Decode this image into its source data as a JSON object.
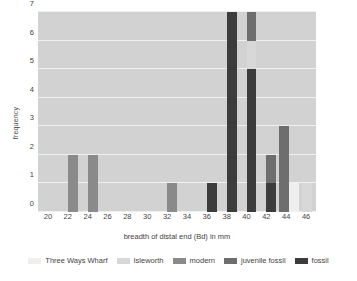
{
  "chart_data": {
    "type": "bar",
    "title": "",
    "xlabel": "breadth of distal end (Bd) in mm",
    "ylabel": "frequency",
    "xlim": [
      19,
      47
    ],
    "ylim": [
      0,
      7
    ],
    "yticks": [
      0,
      1,
      2,
      3,
      4,
      5,
      6,
      7
    ],
    "xticks": [
      20,
      22,
      24,
      26,
      28,
      30,
      32,
      34,
      36,
      38,
      40,
      42,
      44,
      46
    ],
    "grid": true,
    "stacked": true,
    "legend_position": "bottom",
    "plot_background": "#d2d2d2",
    "gridline_color": "#f0f0f0",
    "series": [
      {
        "name": "Three Ways Wharf",
        "color": "#efefef"
      },
      {
        "name": "Isleworth",
        "color": "#d8d8d8"
      },
      {
        "name": "modern",
        "color": "#8a8a8a"
      },
      {
        "name": "juvenile fossil",
        "color": "#6e6e6e"
      },
      {
        "name": "fossil",
        "color": "#3c3c3c"
      }
    ],
    "bins": [
      {
        "x": 22,
        "width": 1,
        "segments": [
          {
            "series": "modern",
            "value": 2
          }
        ]
      },
      {
        "x": 24,
        "width": 1,
        "segments": [
          {
            "series": "modern",
            "value": 2
          }
        ]
      },
      {
        "x": 32,
        "width": 1,
        "segments": [
          {
            "series": "modern",
            "value": 1
          }
        ]
      },
      {
        "x": 36,
        "width": 1,
        "segments": [
          {
            "series": "fossil",
            "value": 1
          }
        ]
      },
      {
        "x": 38,
        "width": 1,
        "segments": [
          {
            "series": "fossil",
            "value": 7
          }
        ]
      },
      {
        "x": 40,
        "width": 1,
        "segments": [
          {
            "series": "fossil",
            "value": 5
          },
          {
            "series": "Isleworth",
            "value": 1
          },
          {
            "series": "juvenile fossil",
            "value": 1
          }
        ]
      },
      {
        "x": 42,
        "width": 1,
        "segments": [
          {
            "series": "fossil",
            "value": 1
          },
          {
            "series": "juvenile fossil",
            "value": 1
          }
        ]
      },
      {
        "x": 43.3,
        "width": 1,
        "segments": [
          {
            "series": "juvenile fossil",
            "value": 3
          }
        ]
      },
      {
        "x": 44.3,
        "width": 1,
        "segments": [
          {
            "series": "Three Ways Wharf",
            "value": 1
          }
        ]
      },
      {
        "x": 45.6,
        "width": 1,
        "segments": [
          {
            "series": "Isleworth",
            "value": 1
          }
        ]
      }
    ]
  }
}
